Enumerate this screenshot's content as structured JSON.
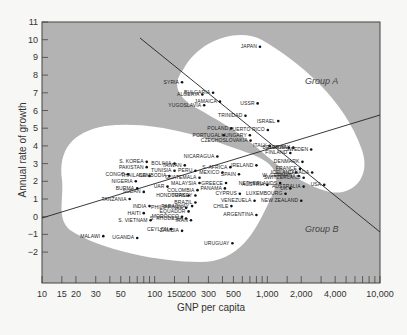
{
  "chart_data": {
    "type": "scatter",
    "title": "",
    "xlabel": "GNP per capita",
    "ylabel": "Annual rate of growth",
    "xscale": "log",
    "xlim": [
      10,
      10000
    ],
    "ylim": [
      -4.5,
      11
    ],
    "x_ticks": [
      "10",
      "15",
      "20",
      "30",
      "50",
      "100",
      "150",
      "200",
      "300",
      "500",
      "1,000",
      "2,000",
      "4,000",
      "10,000"
    ],
    "y_ticks": [
      "11",
      "10",
      "9",
      "8",
      "7",
      "6",
      "5",
      "4",
      "3",
      "2",
      "1",
      "0",
      "−1",
      "−2"
    ],
    "grid": false,
    "colors": {
      "background": "#b3b3b3",
      "region": "#ffffff",
      "point": "#111111",
      "line": "#222222"
    },
    "groups": [
      {
        "name": "Group A"
      },
      {
        "name": "Group B"
      }
    ],
    "points": [
      {
        "name": "JAPAN",
        "x": 860,
        "y": 9.6
      },
      {
        "name": "SYRIA",
        "x": 175,
        "y": 7.6
      },
      {
        "name": "BULGARIA",
        "x": 330,
        "y": 7.0
      },
      {
        "name": "ALGERIA",
        "x": 265,
        "y": 6.9
      },
      {
        "name": "JAMAICA",
        "x": 380,
        "y": 6.5
      },
      {
        "name": "USSR",
        "x": 820,
        "y": 6.4
      },
      {
        "name": "YUGOSLAVIA",
        "x": 275,
        "y": 6.3
      },
      {
        "name": "TRINIDAD",
        "x": 640,
        "y": 5.7
      },
      {
        "name": "ISRAEL",
        "x": 1250,
        "y": 5.4
      },
      {
        "name": "POLAND",
        "x": 480,
        "y": 5.0
      },
      {
        "name": "PUERTO RICO",
        "x": 1010,
        "y": 4.9
      },
      {
        "name": "PORTUGAL",
        "x": 410,
        "y": 4.6
      },
      {
        "name": "HUNGARY",
        "x": 700,
        "y": 4.6
      },
      {
        "name": "CZECHOSLOVAKIA",
        "x": 710,
        "y": 4.3
      },
      {
        "name": "ITALY",
        "x": 1050,
        "y": 4.0
      },
      {
        "name": "BELGIUM",
        "x": 1550,
        "y": 3.9
      },
      {
        "name": "NORWAY",
        "x": 1700,
        "y": 3.9
      },
      {
        "name": "SWEDEN",
        "x": 2450,
        "y": 3.8
      },
      {
        "name": "FINLAND",
        "x": 1600,
        "y": 3.6
      },
      {
        "name": "NICARAGUA",
        "x": 360,
        "y": 3.4
      },
      {
        "name": "IRELAND",
        "x": 800,
        "y": 2.9
      },
      {
        "name": "DENMARK",
        "x": 2050,
        "y": 3.1
      },
      {
        "name": "FRANCE",
        "x": 1950,
        "y": 2.7
      },
      {
        "name": "ICELAND",
        "x": 1800,
        "y": 2.5
      },
      {
        "name": "CANADA",
        "x": 2500,
        "y": 2.5
      },
      {
        "name": "W. GERMANY",
        "x": 1900,
        "y": 2.3
      },
      {
        "name": "SWITZERLAND",
        "x": 2100,
        "y": 2.2
      },
      {
        "name": "USA",
        "x": 3200,
        "y": 1.8
      },
      {
        "name": "NETHERLANDS",
        "x": 1300,
        "y": 1.9
      },
      {
        "name": "AUSTRIA",
        "x": 1000,
        "y": 1.8
      },
      {
        "name": "UK",
        "x": 1600,
        "y": 1.6
      },
      {
        "name": "AUSTRALIA",
        "x": 2100,
        "y": 1.7
      },
      {
        "name": "LUXEMBOURG",
        "x": 1450,
        "y": 1.3
      },
      {
        "name": "NEW ZEALAND",
        "x": 2000,
        "y": 0.9
      },
      {
        "name": "TAIWAN",
        "x": 185,
        "y": 2.9
      },
      {
        "name": "S. AFRICA",
        "x": 470,
        "y": 2.8
      },
      {
        "name": "S. KOREA",
        "x": 85,
        "y": 3.1
      },
      {
        "name": "BOLIVIA",
        "x": 150,
        "y": 3.0
      },
      {
        "name": "PERU",
        "x": 230,
        "y": 2.6
      },
      {
        "name": "MEXICO",
        "x": 400,
        "y": 2.5
      },
      {
        "name": "SPAIN",
        "x": 560,
        "y": 2.4
      },
      {
        "name": "PAKISTAN",
        "x": 85,
        "y": 2.8
      },
      {
        "name": "TUNISIA",
        "x": 150,
        "y": 2.6
      },
      {
        "name": "GUATEMALA",
        "x": 250,
        "y": 2.2
      },
      {
        "name": "CONGO",
        "x": 58,
        "y": 2.4
      },
      {
        "name": "THAILAND",
        "x": 90,
        "y": 2.3
      },
      {
        "name": "CAMBODIA",
        "x": 135,
        "y": 2.3
      },
      {
        "name": "MALAYSIA",
        "x": 250,
        "y": 1.9
      },
      {
        "name": "GREECE",
        "x": 430,
        "y": 1.9
      },
      {
        "name": "NIGERIA",
        "x": 68,
        "y": 2.0
      },
      {
        "name": "BURMA",
        "x": 70,
        "y": 1.6
      },
      {
        "name": "UAR",
        "x": 130,
        "y": 1.7
      },
      {
        "name": "COLOMBIA",
        "x": 240,
        "y": 1.5
      },
      {
        "name": "PANAMA",
        "x": 420,
        "y": 1.6
      },
      {
        "name": "SUDAN",
        "x": 80,
        "y": 1.4
      },
      {
        "name": "HONDURAS",
        "x": 200,
        "y": 1.2
      },
      {
        "name": "TURKEY",
        "x": 230,
        "y": 1.2
      },
      {
        "name": "CYPRUS",
        "x": 570,
        "y": 1.3
      },
      {
        "name": "TANZANIA",
        "x": 60,
        "y": 1.0
      },
      {
        "name": "BRAZIL",
        "x": 230,
        "y": 0.8
      },
      {
        "name": "PARAGUAY",
        "x": 215,
        "y": 0.6
      },
      {
        "name": "CHILE",
        "x": 480,
        "y": 0.6
      },
      {
        "name": "VENEZUELA",
        "x": 770,
        "y": 0.9
      },
      {
        "name": "INDIA",
        "x": 90,
        "y": 0.6
      },
      {
        "name": "PHILIPPINES",
        "x": 190,
        "y": 0.5
      },
      {
        "name": "EQUADOR",
        "x": 200,
        "y": 0.3
      },
      {
        "name": "HAITI",
        "x": 80,
        "y": 0.2
      },
      {
        "name": "MOROCCO",
        "x": 175,
        "y": 0.0
      },
      {
        "name": "S. RHODESIA",
        "x": 190,
        "y": -0.1
      },
      {
        "name": "ARGENTINA",
        "x": 800,
        "y": 0.1
      },
      {
        "name": "IRAN",
        "x": 210,
        "y": -0.2
      },
      {
        "name": "S. VIETNAM",
        "x": 92,
        "y": -0.2
      },
      {
        "name": "CEYLON",
        "x": 140,
        "y": -0.7
      },
      {
        "name": "ZAMBIA",
        "x": 175,
        "y": -0.8
      },
      {
        "name": "MALAWI",
        "x": 35,
        "y": -1.1
      },
      {
        "name": "UGANDA",
        "x": 70,
        "y": -1.2
      },
      {
        "name": "URUGUAY",
        "x": 490,
        "y": -1.5
      }
    ]
  },
  "labels": {
    "xlabel": "GNP per capita",
    "ylabel": "Annual rate of growth",
    "group_a": "Group A",
    "group_b": "Group B"
  },
  "x_ticks": [
    "10",
    "15",
    "20",
    "30",
    "50",
    "100",
    "150",
    "200",
    "300",
    "500",
    "1,000",
    "2,000",
    "4,000",
    "10,000"
  ],
  "y_ticks": [
    "11",
    "10",
    "9",
    "8",
    "7",
    "6",
    "5",
    "4",
    "3",
    "2",
    "1",
    "0",
    "−1",
    "−2"
  ]
}
